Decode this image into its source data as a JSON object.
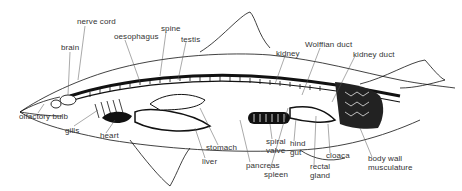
{
  "diagram": {
    "labels": {
      "nerve_cord": "nerve cord",
      "brain": "brain",
      "oesophagus": "oesophagus",
      "spine": "spine",
      "testis": "testis",
      "kidney": "kidney",
      "wolffian_duct": "Wolffian duct",
      "kidney_duct": "kidney duct",
      "olfactory_bulb": "olfactory bulb",
      "gills": "gills",
      "heart": "heart",
      "liver": "liver",
      "stomach": "stomach",
      "pancreas": "pancreas",
      "spiral_valve_1": "spiral",
      "spiral_valve_2": "valve",
      "hind_gut_1": "hind",
      "hind_gut_2": "gut",
      "spleen": "spleen",
      "rectal_gland_1": "rectal",
      "rectal_gland_2": "gland",
      "cloaca": "cloaca",
      "body_wall_1": "body wall",
      "body_wall_2": "musculature"
    },
    "colors": {
      "ink": "#111111",
      "label": "#333333",
      "background": "#ffffff"
    }
  }
}
